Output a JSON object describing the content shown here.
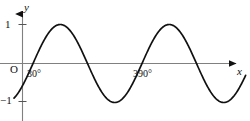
{
  "figure": {
    "name": "sine-curve-graph",
    "background_color": "#ffffff",
    "curve_color": "#111111",
    "axis_color": "#808080"
  },
  "axes": {
    "y_axis_label": "y",
    "x_axis_label": "x",
    "origin_label": "O",
    "y_ticks": [
      {
        "label": "1",
        "value": 1
      },
      {
        "label": "−1",
        "value": -1
      }
    ],
    "x_ticks": [
      {
        "label": "30°",
        "value": 30
      },
      {
        "label": "390°",
        "value": 390
      }
    ]
  },
  "chart_data": {
    "type": "line",
    "title": "",
    "xlabel": "x",
    "ylabel": "y",
    "function": "y = sin(x − 30°)",
    "amplitude": 1,
    "period": 360,
    "phase_shift_degrees": 30,
    "xlim": [
      -15,
      760
    ],
    "ylim": [
      -1.35,
      1.35
    ],
    "grid": false,
    "legend": false,
    "x_tick_values": [
      30,
      390
    ],
    "x_tick_labels": [
      "30°",
      "390°"
    ],
    "y_tick_values": [
      1,
      -1
    ],
    "y_tick_labels": [
      "1",
      "−1"
    ],
    "zero_crossings_degrees": [
      30,
      210,
      390,
      570
    ],
    "maxima_degrees": [
      120,
      480
    ],
    "minima_degrees": [
      300,
      660
    ],
    "x": [
      -60,
      -45,
      -30,
      -15,
      0,
      15,
      30,
      45,
      60,
      75,
      90,
      105,
      120,
      135,
      150,
      165,
      180,
      195,
      210,
      225,
      240,
      255,
      270,
      285,
      300,
      315,
      330,
      345,
      360,
      375,
      390,
      405,
      420,
      435,
      450,
      465,
      480,
      495,
      510,
      525,
      540,
      555,
      570,
      585,
      600,
      615,
      630,
      645,
      660,
      675,
      690,
      705,
      720,
      735,
      750
    ],
    "y": [
      -0.866,
      -0.966,
      -1.0,
      -0.966,
      -0.5,
      -0.259,
      0.0,
      0.259,
      0.5,
      0.707,
      0.866,
      0.966,
      1.0,
      0.966,
      0.866,
      0.707,
      0.5,
      0.259,
      0.0,
      -0.259,
      -0.5,
      -0.707,
      -0.866,
      -0.966,
      -1.0,
      -0.966,
      -0.866,
      -0.707,
      -0.5,
      -0.259,
      0.0,
      0.259,
      0.5,
      0.707,
      0.866,
      0.966,
      1.0,
      0.966,
      0.866,
      0.707,
      0.5,
      0.259,
      0.0,
      -0.259,
      -0.5,
      -0.707,
      -0.866,
      -0.966,
      -1.0,
      -0.966,
      -0.866,
      -0.707,
      -0.5,
      -0.259,
      0.0
    ],
    "series": [
      {
        "name": "y = sin(x − 30°)",
        "values": [
          -0.866,
          -0.966,
          -1.0,
          -0.966,
          -0.5,
          -0.259,
          0.0,
          0.259,
          0.5,
          0.707,
          0.866,
          0.966,
          1.0,
          0.966,
          0.866,
          0.707,
          0.5,
          0.259,
          0.0,
          -0.259,
          -0.5,
          -0.707,
          -0.866,
          -0.966,
          -1.0,
          -0.966,
          -0.866,
          -0.707,
          -0.5,
          -0.259,
          0.0,
          0.259,
          0.5,
          0.707,
          0.866,
          0.966,
          1.0,
          0.966,
          0.866,
          0.707,
          0.5,
          0.259,
          0.0,
          -0.259,
          -0.5,
          -0.707,
          -0.866,
          -0.966,
          -1.0,
          -0.966,
          -0.866,
          -0.707,
          -0.5,
          -0.259,
          0.0
        ]
      }
    ]
  }
}
